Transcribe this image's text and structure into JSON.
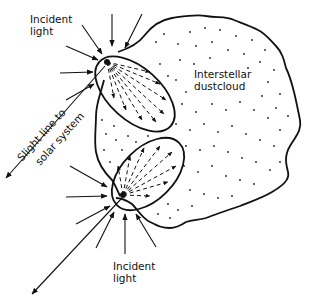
{
  "diagram": {
    "labels": {
      "incident_light_top_line1": "Incident",
      "incident_light_top_line2": "light",
      "incident_light_bottom_line1": "Incident",
      "incident_light_bottom_line2": "light",
      "sight_line_line1": "Slight line to",
      "sight_line_line2": "solar system",
      "cloud_line1": "Interstellar",
      "cloud_line2": "dustcloud"
    },
    "colors": {
      "ink": "#111111",
      "background": "#ffffff"
    }
  }
}
